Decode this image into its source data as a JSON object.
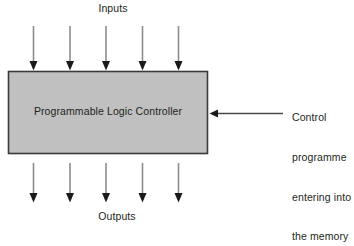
{
  "diagram": {
    "title_top": "Inputs",
    "title_bottom": "Outputs",
    "block": {
      "label": "Programmable Logic Controller",
      "fill_color": "#c0c0c0",
      "border_color": "#3a3a3a",
      "x": 8,
      "y": 71,
      "width": 200,
      "height": 83
    },
    "input_arrows": {
      "count": 5,
      "direction": "down",
      "x_positions": [
        33,
        70,
        106,
        142,
        178
      ],
      "y_start": 26,
      "y_end": 70,
      "shaft_color": "#8d8d8d",
      "head_color": "#1a1a1a"
    },
    "output_arrows": {
      "count": 5,
      "direction": "down",
      "x_positions": [
        33,
        70,
        106,
        142,
        178
      ],
      "y_start": 163,
      "y_end": 202,
      "shaft_color": "#8d8d8d",
      "head_color": "#1a1a1a"
    },
    "control_arrow": {
      "direction": "left",
      "x_start": 283,
      "x_end": 210,
      "y": 113,
      "shaft_color": "#4a4a4a",
      "head_color": "#1a1a1a"
    },
    "control_note": {
      "line1": "Control",
      "line2": "programme",
      "line3": "entering into",
      "line4": "the memory"
    }
  }
}
